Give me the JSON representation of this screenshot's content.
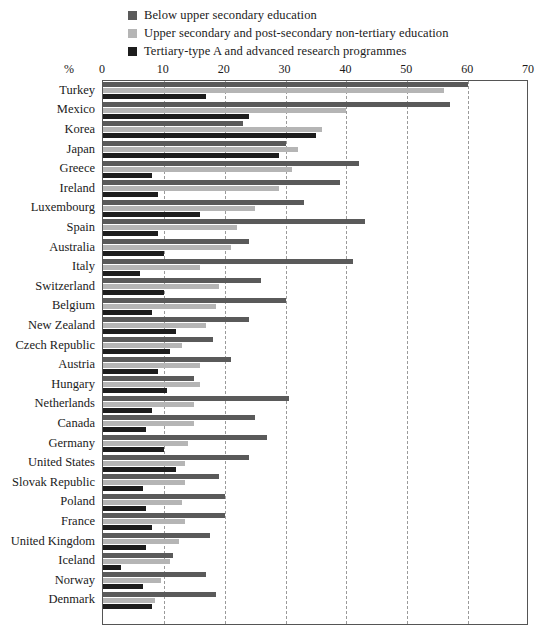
{
  "legend": {
    "items": [
      {
        "label": "Below upper secondary education",
        "color": "#5a5a5a",
        "icon": "legend-swatch"
      },
      {
        "label": "Upper secondary and post-secondary non-tertiary education",
        "color": "#b5b5b5",
        "icon": "legend-swatch"
      },
      {
        "label": "Tertiary-type A and advanced research programmes",
        "color": "#1d1d1d",
        "icon": "legend-swatch"
      }
    ]
  },
  "axis": {
    "unit_label": "%",
    "tick_labels": [
      "0",
      "10",
      "20",
      "30",
      "40",
      "50",
      "60",
      "70"
    ]
  },
  "chart_data": {
    "type": "bar",
    "orientation": "horizontal",
    "title": "",
    "subtitle": "",
    "xlabel": "%",
    "ylabel": "",
    "xlim": [
      0,
      70
    ],
    "xticks": [
      0,
      10,
      20,
      30,
      40,
      50,
      60,
      70
    ],
    "grid": true,
    "grid_axis": "x",
    "legend_position": "top-left",
    "categories": [
      "Turkey",
      "Mexico",
      "Korea",
      "Japan",
      "Greece",
      "Ireland",
      "Luxembourg",
      "Spain",
      "Australia",
      "Italy",
      "Switzerland",
      "Belgium",
      "New Zealand",
      "Czech Republic",
      "Austria",
      "Hungary",
      "Netherlands",
      "Canada",
      "Germany",
      "United States",
      "Slovak Republic",
      "Poland",
      "France",
      "United Kingdom",
      "Iceland",
      "Norway",
      "Denmark"
    ],
    "series": [
      {
        "name": "Below upper secondary education",
        "color": "#5a5a5a",
        "values": [
          60.0,
          57.0,
          23.0,
          30.0,
          42.0,
          39.0,
          33.0,
          43.0,
          24.0,
          41.0,
          26.0,
          30.0,
          24.0,
          18.0,
          21.0,
          15.0,
          30.5,
          25.0,
          27.0,
          24.0,
          19.0,
          20.0,
          20.0,
          17.5,
          11.5,
          17.0,
          18.5
        ]
      },
      {
        "name": "Upper secondary and post-secondary non-tertiary education",
        "color": "#b5b5b5",
        "values": [
          56.0,
          40.0,
          36.0,
          32.0,
          31.0,
          29.0,
          25.0,
          22.0,
          21.0,
          16.0,
          19.0,
          18.5,
          17.0,
          13.0,
          16.0,
          16.0,
          15.0,
          15.0,
          14.0,
          13.5,
          13.5,
          13.0,
          13.5,
          12.5,
          11.0,
          9.5,
          8.5
        ]
      },
      {
        "name": "Tertiary-type A and advanced research programmes",
        "color": "#1d1d1d",
        "values": [
          17.0,
          24.0,
          35.0,
          29.0,
          8.0,
          9.0,
          16.0,
          9.0,
          10.0,
          6.0,
          10.0,
          8.0,
          12.0,
          11.0,
          9.0,
          10.5,
          8.0,
          7.0,
          10.0,
          12.0,
          6.5,
          7.0,
          8.0,
          7.0,
          3.0,
          6.5,
          8.0
        ]
      }
    ]
  }
}
